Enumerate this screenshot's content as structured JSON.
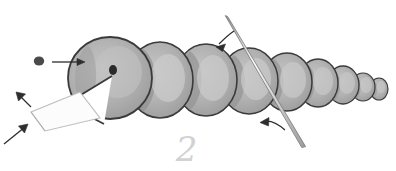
{
  "figure": {
    "background_color": "#ffffff",
    "width": 396,
    "height": 171,
    "watermark_label": "2",
    "palette": {
      "body_fill": "#a9a9a9",
      "body_fill_light": "#c0c0c0",
      "body_highlight": "#bdbdbd",
      "body_shadow": "#8e8e8e",
      "outline": "#3a3a3a",
      "eye": "#2b2b2b",
      "dot_marker": "#4a4a4a",
      "arrow": "#2e2e2e",
      "needle_fill": "#f2f2f2",
      "needle_edge": "#707070",
      "sheet_fill": "#fcfcfc",
      "sheet_edge": "#b9b9b9",
      "watermark": "#d2d2d2"
    },
    "segments": [
      {
        "name": "head-segment",
        "label": "head",
        "cx": 110,
        "cy": 78,
        "rx": 42,
        "ry": 41
      },
      {
        "name": "body-segment-1",
        "label": "segment 1",
        "cx": 160,
        "cy": 80,
        "rx": 33,
        "ry": 38
      },
      {
        "name": "body-segment-2",
        "label": "segment 2",
        "cx": 206,
        "cy": 80,
        "rx": 31,
        "ry": 36
      },
      {
        "name": "body-segment-3",
        "label": "segment 3",
        "cx": 249,
        "cy": 81,
        "rx": 29,
        "ry": 33
      },
      {
        "name": "body-segment-4",
        "label": "segment 4",
        "cx": 287,
        "cy": 82,
        "rx": 25,
        "ry": 29
      },
      {
        "name": "body-segment-5",
        "label": "segment 5",
        "cx": 318,
        "cy": 83,
        "rx": 20,
        "ry": 24
      },
      {
        "name": "body-segment-6",
        "label": "segment 6",
        "cx": 343,
        "cy": 85,
        "rx": 16,
        "ry": 19
      },
      {
        "name": "body-segment-7",
        "label": "segment 7",
        "cx": 363,
        "cy": 87,
        "rx": 12,
        "ry": 14
      },
      {
        "name": "body-segment-8",
        "label": "segment 8 (tail tip)",
        "cx": 379,
        "cy": 89,
        "rx": 9,
        "ry": 11
      }
    ],
    "eye": {
      "name": "eye-dot",
      "cx": 113,
      "cy": 70,
      "rx": 4.0,
      "ry": 5.0
    },
    "marker_dot": {
      "name": "marker-dot",
      "cx": 39,
      "cy": 61,
      "rx": 5.2,
      "ry": 4.6
    },
    "needle": {
      "name": "needle-rod",
      "label": "needle",
      "x1": 226,
      "y1": 16,
      "x2": 304,
      "y2": 146,
      "width_top": 2.0,
      "width_bottom": 3.2
    },
    "sheet": {
      "name": "flat-sheet",
      "label": "sheet",
      "points": "80,92 31,112 45,131 100,118"
    },
    "arrows": [
      {
        "name": "arrow-to-head",
        "kind": "straight",
        "label": "points right toward head",
        "d": "M 52 62 L 84 62",
        "head": "M 84 62 L 77 58.5 L 77 65.5 Z"
      },
      {
        "name": "arrow-to-sheet-upper",
        "kind": "straight",
        "label": "points up-left at sheet edge",
        "d": "M 31 106 L 17 93",
        "head": "M 17 93 L 25 94 L 19 101 Z"
      },
      {
        "name": "arrow-to-sheet-lower",
        "kind": "straight",
        "label": "points up-left at sheet edge",
        "d": "M 5 143 L 27 125",
        "head": "M 27 125 L 18 126 L 24 133 Z"
      },
      {
        "name": "arrow-to-needle-upper",
        "kind": "curved",
        "label": "curved arrow pointing down-left at needle",
        "d": "M 233 32 C 227 36 222 40 217 45",
        "head": "M 217 45 L 225 43 L 222 50 Z"
      },
      {
        "name": "arrow-to-needle-lower",
        "kind": "curved",
        "label": "curved arrow pointing left under needle",
        "d": "M 283 129 C 275 122 268 120 261 122",
        "head": "M 261 122 L 269 118 L 268 126 Z"
      }
    ]
  }
}
